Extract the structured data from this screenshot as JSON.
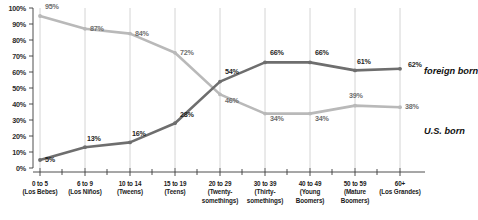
{
  "chart_data": {
    "type": "line",
    "title": "",
    "xlabel": "",
    "ylabel": "",
    "ylim": [
      0,
      100
    ],
    "ytick_labels": [
      "100%",
      "90%",
      "80%",
      "70%",
      "60%",
      "50%",
      "40%",
      "30%",
      "20%",
      "10%",
      "0%"
    ],
    "ytick_values": [
      100,
      90,
      80,
      70,
      60,
      50,
      40,
      30,
      20,
      10,
      0
    ],
    "grid": "vertical",
    "legend_position": "right",
    "categories": [
      "0 to 5",
      "6 to 9",
      "10 to 14",
      "15 to 19",
      "20 to 29",
      "30 to 39",
      "40 to 49",
      "50 to 59",
      "60+"
    ],
    "category_sublabels": [
      "(Los Bebes)",
      "(Los Niños)",
      "(Tweens)",
      "(Teens)",
      "(Twenty-somethings)",
      "(Thirty-somethings)",
      "(Young Boomers)",
      "(Mature Boomers)",
      "(Los Grandes)"
    ],
    "series": [
      {
        "name": "U.S. born",
        "color": "#b9b9b9",
        "values": [
          95,
          87,
          84,
          72,
          46,
          34,
          34,
          39,
          38
        ],
        "point_labels": [
          "95%",
          "87%",
          "84%",
          "72%",
          "46%",
          "34%",
          "34%",
          "39%",
          "38%"
        ]
      },
      {
        "name": "foreign born",
        "color": "#6e6e6e",
        "values": [
          5,
          13,
          16,
          28,
          54,
          66,
          66,
          61,
          62
        ],
        "point_labels": [
          "5%",
          "13%",
          "16%",
          "28%",
          "54%",
          "66%",
          "66%",
          "61%",
          "62%"
        ]
      }
    ]
  },
  "legend": {
    "foreign_born": "foreign born",
    "us_born": "U.S. born"
  },
  "xaxis": {
    "labels": [
      {
        "line1": "0 to 5",
        "line2": "(Los Bebes)",
        "line3": ""
      },
      {
        "line1": "6 to 9",
        "line2": "(Los Niños)",
        "line3": ""
      },
      {
        "line1": "10 to 14",
        "line2": "(Tweens)",
        "line3": ""
      },
      {
        "line1": "15 to 19",
        "line2": "(Teens)",
        "line3": ""
      },
      {
        "line1": "20 to 29",
        "line2": "(Twenty-",
        "line3": "somethings)"
      },
      {
        "line1": "30 to 39",
        "line2": "(Thirty-",
        "line3": "somethings)"
      },
      {
        "line1": "40 to 49",
        "line2": "(Young",
        "line3": "Boomers)"
      },
      {
        "line1": "50 to 59",
        "line2": "(Mature",
        "line3": "Boomers)"
      },
      {
        "line1": "60+",
        "line2": "(Los Grandes)",
        "line3": ""
      }
    ]
  }
}
